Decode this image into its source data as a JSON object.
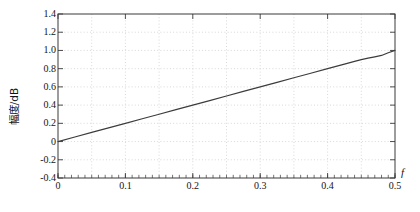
{
  "chart_data": {
    "type": "line",
    "title": "",
    "subtitle": "",
    "xlabel": "f",
    "ylabel": "幅度/dB",
    "xlim": [
      0,
      0.5
    ],
    "ylim": [
      -0.4,
      1.4
    ],
    "grid": true,
    "legend": false,
    "legend_position": "none",
    "x_ticks": [
      0,
      0.1,
      0.2,
      0.3,
      0.4,
      0.5
    ],
    "x_tick_labels": [
      "0",
      "0.1",
      "0.2",
      "0.3",
      "0.4",
      "0.5"
    ],
    "x_minor_tick_step": 0.01,
    "y_ticks": [
      -0.4,
      -0.2,
      0,
      0.2,
      0.4,
      0.6,
      0.8,
      1.0,
      1.2,
      1.4
    ],
    "y_tick_labels": [
      "-0.4",
      "-0.2",
      "0",
      "0.2",
      "0.4",
      "0.6",
      "0.8",
      "1.0",
      "1.2",
      "1.4"
    ],
    "x_gridline_values": [
      0.05,
      0.1,
      0.15,
      0.2,
      0.25,
      0.3,
      0.35,
      0.4,
      0.45
    ],
    "y_gridline_values": [
      -0.2,
      0,
      0.2,
      0.4,
      0.6,
      0.8,
      1.0,
      1.2
    ],
    "series": [
      {
        "name": "幅度响应",
        "color": "#3c3c3c",
        "line_width": 1.2,
        "x": [
          0,
          0.025,
          0.05,
          0.075,
          0.1,
          0.125,
          0.15,
          0.175,
          0.2,
          0.225,
          0.25,
          0.275,
          0.3,
          0.325,
          0.35,
          0.375,
          0.4,
          0.425,
          0.44,
          0.45,
          0.46,
          0.47,
          0.48,
          0.49,
          0.5
        ],
        "y": [
          0.0,
          0.05,
          0.1,
          0.15,
          0.2,
          0.25,
          0.3,
          0.35,
          0.4,
          0.45,
          0.5,
          0.55,
          0.6,
          0.65,
          0.7,
          0.75,
          0.8,
          0.85,
          0.88,
          0.9,
          0.915,
          0.93,
          0.945,
          0.975,
          1.0
        ]
      }
    ]
  },
  "style": {
    "background": "#ffffff",
    "axis_color": "#3a3a3a",
    "grid_color": "#c8c8c8",
    "text_color": "#141414",
    "line_color": "#3c3c3c"
  },
  "plot_box": {
    "left": 58,
    "top": 14,
    "right": 395,
    "bottom": 178
  }
}
